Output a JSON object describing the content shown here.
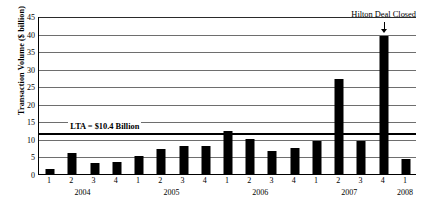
{
  "chart_data": {
    "type": "bar",
    "title": "",
    "xlabel": "",
    "ylabel": "Transaction Volume ($ billion)",
    "ylim": [
      0,
      45
    ],
    "ytick_step": 5,
    "yticks": [
      "0",
      "5",
      "10",
      "15",
      "20",
      "25",
      "30",
      "35",
      "40",
      "45"
    ],
    "grid": true,
    "legend": "none",
    "categories": [
      "1 2004",
      "2 2004",
      "3 2004",
      "4 2004",
      "1 2005",
      "2 2005",
      "3 2005",
      "4 2005",
      "1 2006",
      "2 2006",
      "3 2006",
      "4 2006",
      "1 2007",
      "2 2007",
      "3 2007",
      "4 2007",
      "1 2008"
    ],
    "quarter_labels": [
      "1",
      "2",
      "3",
      "4",
      "1",
      "2",
      "3",
      "4",
      "1",
      "2",
      "3",
      "4",
      "1",
      "2",
      "3",
      "4",
      "1"
    ],
    "year_groups": [
      {
        "year": "2004",
        "start_index": 0,
        "end_index": 3
      },
      {
        "year": "2005",
        "start_index": 4,
        "end_index": 7
      },
      {
        "year": "2006",
        "start_index": 8,
        "end_index": 11
      },
      {
        "year": "2007",
        "start_index": 12,
        "end_index": 15
      },
      {
        "year": "2008",
        "start_index": 16,
        "end_index": 16
      }
    ],
    "values": [
      1.8,
      6.3,
      3.3,
      3.8,
      5.5,
      7.5,
      8.2,
      8.3,
      12.5,
      10.3,
      6.8,
      7.8,
      9.8,
      27.3,
      9.8,
      39.5,
      4.5
    ],
    "bar_color": "#000000",
    "reference_line": {
      "label": "LTA = $10.4 Billion",
      "value": 12.0,
      "stated_value": 10.4,
      "color": "#000000"
    },
    "annotations": [
      {
        "text": "Hilton Deal Closed",
        "points_to_index": 15,
        "points_to_value": 39.5
      }
    ]
  }
}
